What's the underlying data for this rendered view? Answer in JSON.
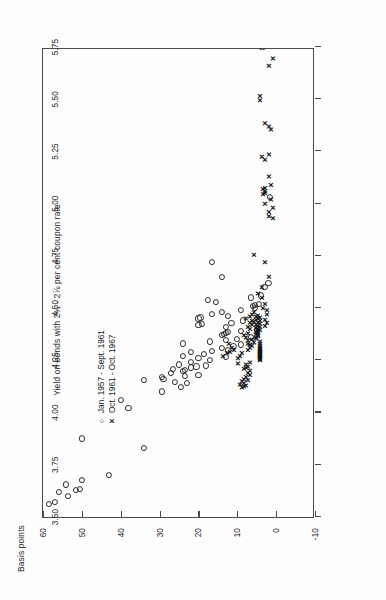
{
  "chart_data": {
    "type": "scatter",
    "title": "",
    "xlabel": "Yield on bonds with 2¾ - 2⅞ per cent coupon rate",
    "ylabel": "Basis points",
    "xlim": [
      3.5,
      5.75
    ],
    "ylim": [
      -10,
      60
    ],
    "grid": false,
    "legend_position": "upper-left",
    "xticks": [
      "3.50",
      "3.75",
      "4.00",
      "4.25",
      "4.50",
      "4.75",
      "5.00",
      "5.25",
      "5.50",
      "5.75"
    ],
    "xtick_values": [
      3.5,
      3.75,
      4.0,
      4.25,
      4.5,
      4.75,
      5.0,
      5.25,
      5.5,
      5.75
    ],
    "yticks": [
      "-10",
      "0",
      "10",
      "20",
      "30",
      "40",
      "50",
      "60"
    ],
    "ytick_values": [
      -10,
      0,
      10,
      20,
      30,
      40,
      50,
      60
    ],
    "series": [
      {
        "name": "Jan. 1957 - Sept. 1961",
        "marker": "circle",
        "marker_glyph": "o",
        "color": "#2b2b2b",
        "points": [
          [
            3.56,
            58.5
          ],
          [
            3.57,
            57.0
          ],
          [
            3.62,
            56.0
          ],
          [
            3.6,
            53.5
          ],
          [
            3.63,
            51.5
          ],
          [
            3.635,
            50.5
          ],
          [
            3.655,
            54.0
          ],
          [
            3.675,
            50.0
          ],
          [
            3.7,
            43.0
          ],
          [
            3.875,
            50.0
          ],
          [
            3.83,
            34.0
          ],
          [
            4.02,
            38.0
          ],
          [
            4.06,
            40.0
          ],
          [
            4.1,
            29.5
          ],
          [
            4.12,
            24.5
          ],
          [
            4.14,
            23.0
          ],
          [
            4.145,
            26.0
          ],
          [
            4.155,
            34.0
          ],
          [
            4.16,
            29.0
          ],
          [
            4.17,
            29.5
          ],
          [
            4.175,
            23.5
          ],
          [
            4.18,
            20.0
          ],
          [
            4.19,
            27.0
          ],
          [
            4.2,
            24.0
          ],
          [
            4.205,
            23.5
          ],
          [
            4.21,
            26.5
          ],
          [
            4.215,
            22.0
          ],
          [
            4.22,
            20.5
          ],
          [
            4.225,
            18.0
          ],
          [
            4.23,
            25.0
          ],
          [
            4.24,
            22.0
          ],
          [
            4.25,
            17.0
          ],
          [
            4.26,
            20.0
          ],
          [
            4.265,
            13.0
          ],
          [
            4.27,
            24.0
          ],
          [
            4.28,
            18.5
          ],
          [
            4.29,
            22.0
          ],
          [
            4.295,
            16.5
          ],
          [
            4.3,
            12.5
          ],
          [
            4.31,
            14.0
          ],
          [
            4.32,
            11.0
          ],
          [
            4.325,
            9.0
          ],
          [
            4.33,
            24.0
          ],
          [
            4.34,
            17.0
          ],
          [
            4.345,
            13.0
          ],
          [
            4.35,
            10.0
          ],
          [
            4.36,
            6.5
          ],
          [
            4.37,
            14.0
          ],
          [
            4.375,
            13.5
          ],
          [
            4.38,
            13.0
          ],
          [
            4.385,
            12.5
          ],
          [
            4.39,
            9.0
          ],
          [
            4.4,
            5.0
          ],
          [
            4.41,
            13.0
          ],
          [
            4.42,
            20.0
          ],
          [
            4.425,
            19.0
          ],
          [
            4.43,
            11.5
          ],
          [
            4.44,
            8.5
          ],
          [
            4.45,
            20.0
          ],
          [
            4.455,
            19.5
          ],
          [
            4.46,
            12.5
          ],
          [
            4.47,
            16.5
          ],
          [
            4.48,
            14.0
          ],
          [
            4.49,
            9.0
          ],
          [
            4.5,
            5.5
          ],
          [
            4.51,
            6.0
          ],
          [
            4.515,
            5.5
          ],
          [
            4.52,
            4.5
          ],
          [
            4.53,
            15.5
          ],
          [
            4.54,
            17.5
          ],
          [
            4.55,
            6.5
          ],
          [
            4.56,
            4.0
          ],
          [
            4.6,
            3.0
          ],
          [
            4.62,
            2.0
          ],
          [
            4.65,
            14.0
          ],
          [
            4.72,
            16.5
          ],
          [
            5.03,
            1.5
          ]
        ]
      },
      {
        "name": "Oct. 1961 - Oct. 1967",
        "marker": "x",
        "marker_glyph": "x",
        "color": "#111111",
        "points": [
          [
            4.12,
            8.5
          ],
          [
            4.125,
            8.0
          ],
          [
            4.13,
            7.5
          ],
          [
            4.135,
            9.0
          ],
          [
            4.14,
            8.0
          ],
          [
            4.15,
            8.5
          ],
          [
            4.155,
            7.0
          ],
          [
            4.16,
            8.0
          ],
          [
            4.17,
            7.5
          ],
          [
            4.18,
            6.5
          ],
          [
            4.19,
            7.0
          ],
          [
            4.2,
            6.5
          ],
          [
            4.21,
            8.0
          ],
          [
            4.215,
            7.5
          ],
          [
            4.22,
            7.0
          ],
          [
            4.23,
            7.5
          ],
          [
            4.235,
            9.5
          ],
          [
            4.24,
            6.5
          ],
          [
            4.25,
            4.0
          ],
          [
            4.255,
            4.0
          ],
          [
            4.26,
            4.0
          ],
          [
            4.265,
            4.0
          ],
          [
            4.27,
            4.0
          ],
          [
            4.275,
            4.0
          ],
          [
            4.28,
            4.0
          ],
          [
            4.285,
            4.0
          ],
          [
            4.29,
            4.0
          ],
          [
            4.295,
            4.0
          ],
          [
            4.3,
            4.0
          ],
          [
            4.305,
            4.0
          ],
          [
            4.31,
            4.0
          ],
          [
            4.32,
            4.0
          ],
          [
            4.33,
            4.0
          ],
          [
            4.34,
            4.0
          ],
          [
            4.26,
            9.5
          ],
          [
            4.27,
            9.0
          ],
          [
            4.285,
            8.5
          ],
          [
            4.3,
            7.0
          ],
          [
            4.31,
            6.5
          ],
          [
            4.32,
            6.0
          ],
          [
            4.325,
            6.5
          ],
          [
            4.33,
            7.0
          ],
          [
            4.335,
            5.5
          ],
          [
            4.345,
            7.0
          ],
          [
            4.35,
            6.0
          ],
          [
            4.27,
            13.5
          ],
          [
            4.285,
            12.5
          ],
          [
            4.29,
            11.5
          ],
          [
            4.3,
            10.5
          ],
          [
            4.31,
            11.0
          ],
          [
            4.33,
            12.0
          ],
          [
            4.355,
            5.0
          ],
          [
            4.36,
            5.0
          ],
          [
            4.365,
            4.5
          ],
          [
            4.37,
            4.5
          ],
          [
            4.375,
            5.0
          ],
          [
            4.38,
            4.5
          ],
          [
            4.385,
            5.0
          ],
          [
            4.39,
            4.5
          ],
          [
            4.395,
            4.0
          ],
          [
            4.4,
            4.5
          ],
          [
            4.405,
            5.0
          ],
          [
            4.41,
            4.0
          ],
          [
            4.415,
            4.5
          ],
          [
            4.42,
            5.0
          ],
          [
            4.425,
            4.0
          ],
          [
            4.43,
            4.5
          ],
          [
            4.435,
            5.5
          ],
          [
            4.44,
            4.0
          ],
          [
            4.445,
            5.0
          ],
          [
            4.45,
            4.5
          ],
          [
            4.455,
            4.0
          ],
          [
            4.46,
            5.0
          ],
          [
            4.465,
            4.5
          ],
          [
            4.36,
            7.5
          ],
          [
            4.37,
            8.0
          ],
          [
            4.38,
            7.0
          ],
          [
            4.4,
            6.5
          ],
          [
            4.41,
            7.0
          ],
          [
            4.42,
            6.0
          ],
          [
            4.43,
            6.5
          ],
          [
            4.44,
            6.0
          ],
          [
            4.45,
            7.5
          ],
          [
            4.46,
            6.5
          ],
          [
            4.47,
            6.0
          ],
          [
            4.48,
            5.5
          ],
          [
            4.415,
            2.5
          ],
          [
            4.43,
            2.0
          ],
          [
            4.445,
            2.5
          ],
          [
            4.47,
            2.0
          ],
          [
            4.49,
            2.0
          ],
          [
            4.5,
            3.0
          ],
          [
            4.52,
            2.5
          ],
          [
            4.55,
            3.5
          ],
          [
            4.57,
            4.5
          ],
          [
            4.6,
            3.5
          ],
          [
            4.65,
            1.5
          ],
          [
            4.72,
            2.5
          ],
          [
            4.755,
            5.5
          ],
          [
            4.93,
            0.5
          ],
          [
            4.94,
            1.5
          ],
          [
            4.96,
            1.5
          ],
          [
            4.98,
            0.5
          ],
          [
            5.0,
            2.5
          ],
          [
            5.02,
            1.0
          ],
          [
            5.045,
            3.0
          ],
          [
            5.05,
            2.5
          ],
          [
            5.06,
            2.5
          ],
          [
            5.07,
            3.0
          ],
          [
            5.075,
            2.5
          ],
          [
            5.09,
            1.0
          ],
          [
            5.13,
            1.5
          ],
          [
            5.21,
            2.5
          ],
          [
            5.225,
            3.5
          ],
          [
            5.235,
            1.5
          ],
          [
            5.355,
            1.0
          ],
          [
            5.37,
            1.5
          ],
          [
            5.385,
            2.5
          ],
          [
            5.495,
            4.0
          ],
          [
            5.515,
            4.0
          ],
          [
            5.66,
            1.5
          ],
          [
            5.695,
            0.5
          ],
          [
            5.745,
            3.5
          ],
          [
            5.748,
            3.0
          ],
          [
            5.752,
            3.5
          ],
          [
            5.756,
            3.0
          ],
          [
            5.76,
            3.2
          ]
        ]
      }
    ]
  },
  "legend": {
    "items": [
      {
        "glyph": "o",
        "label": "Jan. 1957 - Sept. 1961"
      },
      {
        "glyph": "x",
        "label": "Oct. 1961 - Oct. 1967"
      }
    ]
  },
  "axes": {
    "x_title": "Yield on bonds with 2¾ - 2⅞ per cent coupon rate",
    "y_title": "Basis points"
  }
}
